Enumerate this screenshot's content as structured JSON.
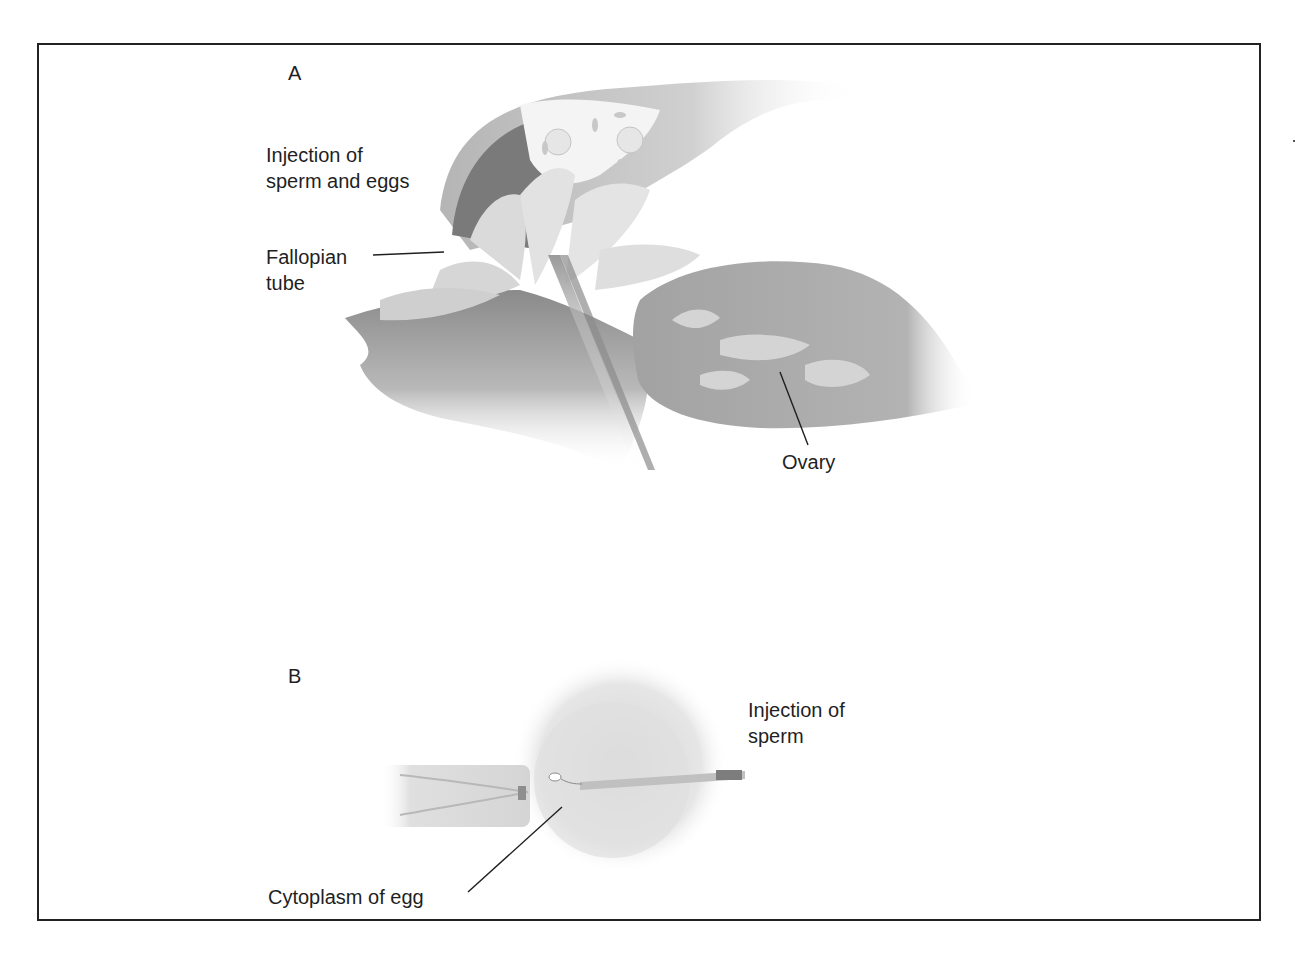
{
  "figure": {
    "panels": [
      {
        "letter": "A",
        "labels": {
          "injection": "Injection of\nsperm and eggs",
          "fallopian": "Fallopian\ntube",
          "ovary": "Ovary"
        }
      },
      {
        "letter": "B",
        "labels": {
          "injection": "Injection of\nsperm",
          "cytoplasm": "Cytoplasm of egg"
        }
      }
    ],
    "colors": {
      "frame": "#222222",
      "text": "#1f1f1f",
      "tissue_dark": "#6f6f6f",
      "tissue_mid": "#a8a8a8",
      "tissue_light": "#d9d9d9"
    }
  }
}
